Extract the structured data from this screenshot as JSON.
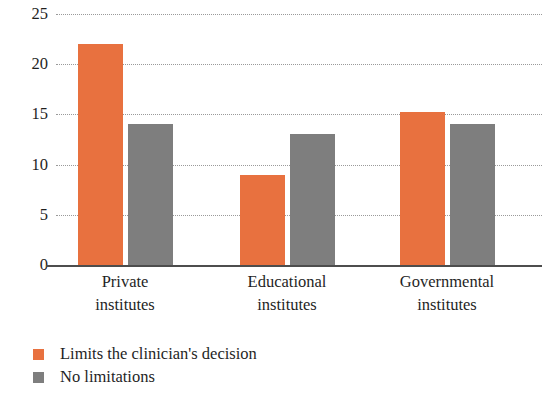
{
  "chart_data": {
    "type": "bar",
    "title": "",
    "subtitle": "",
    "xlabel": "",
    "ylabel": "",
    "categories": [
      "Private\ninstitutes",
      "Educational\ninstitutes",
      "Governmental\ninstitutes"
    ],
    "category_lines": [
      [
        "Private",
        "institutes"
      ],
      [
        "Educational",
        "institutes"
      ],
      [
        "Governmental",
        "institutes"
      ]
    ],
    "series": [
      {
        "name": "Limits the clinician's decision",
        "color": "#e8713f",
        "values": [
          22,
          9,
          15.2
        ]
      },
      {
        "name": "No limitations",
        "color": "#7e7e7e",
        "values": [
          14,
          13,
          14
        ]
      }
    ],
    "ylim": [
      0,
      25
    ],
    "yticks": [
      0,
      5,
      10,
      15,
      20,
      25
    ],
    "ytick_labels": [
      "0",
      "5",
      "10",
      "15",
      "20",
      "25"
    ],
    "grid": true,
    "grid_style": "dotted",
    "legend_position": "bottom-left"
  },
  "axis": {
    "y_labels": [
      "25",
      "20",
      "15",
      "10",
      "5",
      "0"
    ]
  },
  "legend": {
    "items": [
      {
        "label": "Limits the clinician's decision",
        "color": "#e8713f"
      },
      {
        "label": "No limitations",
        "color": "#7e7e7e"
      }
    ]
  }
}
